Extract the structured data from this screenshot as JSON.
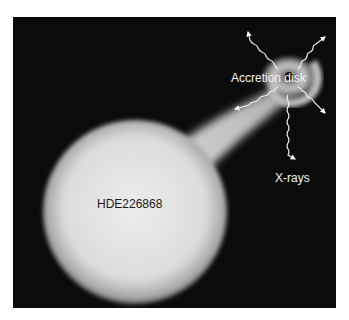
{
  "figure": {
    "labels": {
      "accretion_disk": "Accretion disk",
      "xrays": "X-rays",
      "star": "HDE226868"
    },
    "colors": {
      "background": "#0b0b0b",
      "star": "#e6e6e6",
      "label_light": "#f2f2f2",
      "label_dark": "#1a1a1a"
    }
  }
}
